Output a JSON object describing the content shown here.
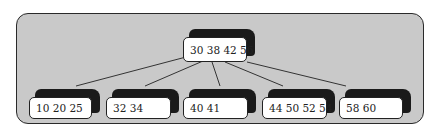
{
  "diagram": {
    "type": "b-tree",
    "root": {
      "keys": "30 38 42 56"
    },
    "children": [
      {
        "keys": "10 20 25"
      },
      {
        "keys": "32 34"
      },
      {
        "keys": "40 41"
      },
      {
        "keys": "44 50 52 54"
      },
      {
        "keys": "58 60"
      }
    ],
    "colors": {
      "panel": "#c9c9c9",
      "node_face": "#ffffff",
      "node_shadow": "#1a1a1a",
      "edge": "#333333"
    }
  }
}
